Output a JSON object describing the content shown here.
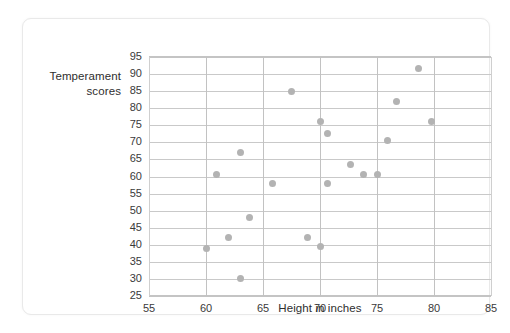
{
  "chart_data": {
    "type": "scatter",
    "title": "",
    "xlabel": "Height in inches",
    "ylabel": "Temperament scores",
    "xlim": [
      55,
      85
    ],
    "ylim": [
      25,
      95
    ],
    "xticks": [
      55,
      60,
      65,
      70,
      75,
      80,
      85
    ],
    "yticks": [
      25,
      30,
      35,
      40,
      45,
      50,
      55,
      60,
      65,
      70,
      75,
      80,
      85,
      90,
      95
    ],
    "grid": true,
    "legend": null,
    "point_color": "#b3b3b3",
    "gridline_color": "#c9c9c9",
    "series": [
      {
        "name": "Dogs",
        "points": [
          {
            "x": 60.0,
            "y": 39.0
          },
          {
            "x": 60.9,
            "y": 60.5
          },
          {
            "x": 62.0,
            "y": 42.0
          },
          {
            "x": 63.0,
            "y": 30.0
          },
          {
            "x": 63.0,
            "y": 67.0
          },
          {
            "x": 63.8,
            "y": 48.0
          },
          {
            "x": 65.8,
            "y": 58.0
          },
          {
            "x": 67.5,
            "y": 85.0
          },
          {
            "x": 68.9,
            "y": 42.0
          },
          {
            "x": 70.0,
            "y": 39.5
          },
          {
            "x": 70.0,
            "y": 76.0
          },
          {
            "x": 70.7,
            "y": 72.5
          },
          {
            "x": 70.7,
            "y": 58.0
          },
          {
            "x": 72.7,
            "y": 63.5
          },
          {
            "x": 73.8,
            "y": 60.5
          },
          {
            "x": 75.0,
            "y": 60.5
          },
          {
            "x": 75.9,
            "y": 70.5
          },
          {
            "x": 76.7,
            "y": 82.0
          },
          {
            "x": 78.6,
            "y": 91.5
          },
          {
            "x": 79.8,
            "y": 76.0
          }
        ]
      }
    ]
  },
  "axis": {
    "y_title_line1": "Temperament",
    "y_title_line2": "scores",
    "x_title": "Height in inches"
  }
}
